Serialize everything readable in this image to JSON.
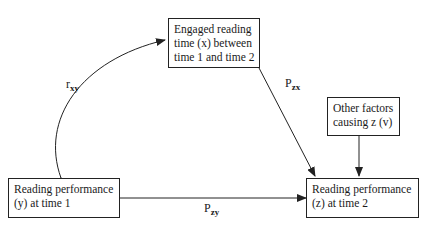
{
  "nodes": {
    "engaged": {
      "lines": [
        "Engaged reading",
        "time (x) between",
        "time 1 and time 2"
      ]
    },
    "other": {
      "lines": [
        "Other factors",
        "causing z (v)"
      ]
    },
    "y": {
      "lines": [
        "Reading performance",
        "(y) at time 1"
      ]
    },
    "z": {
      "lines": [
        "Reading performance",
        "(z) at time 2"
      ]
    }
  },
  "edges": {
    "rxy": {
      "base": "r",
      "sub": "xy"
    },
    "pzx": {
      "base": "P",
      "sub": "zx"
    },
    "pzy": {
      "base": "P",
      "sub": "zy"
    }
  }
}
